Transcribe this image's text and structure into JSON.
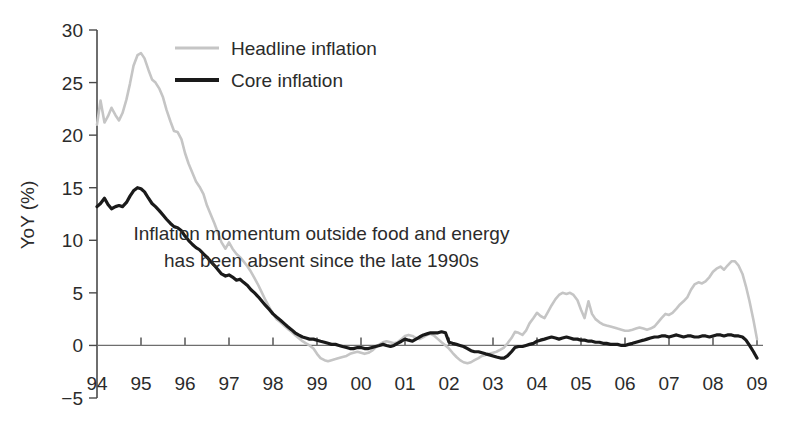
{
  "chart_data": {
    "type": "line",
    "title": "",
    "xlabel": "",
    "ylabel": "YoY (%)",
    "ylim": [
      -5,
      30
    ],
    "xlim": [
      1994,
      2009
    ],
    "grid": false,
    "legend_position": "top-center-left",
    "y_ticks": [
      -5,
      0,
      5,
      10,
      15,
      20,
      25,
      30
    ],
    "y_tick_labels": [
      "−5",
      "0",
      "5",
      "10",
      "15",
      "20",
      "25",
      "30"
    ],
    "x_ticks": [
      1994,
      1995,
      1996,
      1997,
      1998,
      1999,
      2000,
      2001,
      2002,
      2003,
      2004,
      2005,
      2006,
      2007,
      2008,
      2009
    ],
    "x_tick_labels": [
      "94",
      "95",
      "96",
      "97",
      "98",
      "99",
      "00",
      "01",
      "02",
      "03",
      "04",
      "05",
      "06",
      "07",
      "08",
      "09"
    ],
    "annotations": [
      {
        "name": "inflation-momentum-note",
        "lines": [
          "Inflation momentum outside food and energy",
          "has been absent since the late 1990s"
        ],
        "x": 1999.1,
        "y": 10.0
      }
    ],
    "colors": {
      "headline": "#c5c5c5",
      "core": "#1a1a1a",
      "axis": "#4a4a4a",
      "text": "#2b2b2b",
      "background": "#ffffff"
    },
    "series": [
      {
        "name": "Headline inflation",
        "color": "#c5c5c5",
        "width": 2.6,
        "x": [
          1994.0,
          1994.08,
          1994.17,
          1994.25,
          1994.33,
          1994.42,
          1994.5,
          1994.58,
          1994.67,
          1994.75,
          1994.83,
          1994.92,
          1995.0,
          1995.08,
          1995.17,
          1995.25,
          1995.33,
          1995.42,
          1995.5,
          1995.58,
          1995.67,
          1995.75,
          1995.83,
          1995.92,
          1996.0,
          1996.08,
          1996.17,
          1996.25,
          1996.33,
          1996.42,
          1996.5,
          1996.58,
          1996.67,
          1996.75,
          1996.83,
          1996.92,
          1997.0,
          1997.08,
          1997.17,
          1997.25,
          1997.33,
          1997.42,
          1997.5,
          1997.58,
          1997.67,
          1997.75,
          1997.83,
          1997.92,
          1998.0,
          1998.08,
          1998.17,
          1998.25,
          1998.33,
          1998.42,
          1998.5,
          1998.58,
          1998.67,
          1998.75,
          1998.83,
          1998.92,
          1999.0,
          1999.08,
          1999.17,
          1999.25,
          1999.33,
          1999.42,
          1999.5,
          1999.58,
          1999.67,
          1999.75,
          1999.83,
          1999.92,
          2000.0,
          2000.08,
          2000.17,
          2000.25,
          2000.33,
          2000.42,
          2000.5,
          2000.58,
          2000.67,
          2000.75,
          2000.83,
          2000.92,
          2001.0,
          2001.08,
          2001.17,
          2001.25,
          2001.33,
          2001.42,
          2001.5,
          2001.58,
          2001.67,
          2001.75,
          2001.83,
          2001.92,
          2002.0,
          2002.08,
          2002.17,
          2002.25,
          2002.33,
          2002.42,
          2002.5,
          2002.58,
          2002.67,
          2002.75,
          2002.83,
          2002.92,
          2003.0,
          2003.08,
          2003.17,
          2003.25,
          2003.33,
          2003.42,
          2003.5,
          2003.58,
          2003.67,
          2003.75,
          2003.83,
          2003.92,
          2004.0,
          2004.08,
          2004.17,
          2004.25,
          2004.33,
          2004.42,
          2004.5,
          2004.58,
          2004.67,
          2004.75,
          2004.83,
          2004.92,
          2005.0,
          2005.08,
          2005.17,
          2005.25,
          2005.33,
          2005.42,
          2005.5,
          2005.58,
          2005.67,
          2005.75,
          2005.83,
          2005.92,
          2006.0,
          2006.08,
          2006.17,
          2006.25,
          2006.33,
          2006.42,
          2006.5,
          2006.58,
          2006.67,
          2006.75,
          2006.83,
          2006.92,
          2007.0,
          2007.08,
          2007.17,
          2007.25,
          2007.33,
          2007.42,
          2007.5,
          2007.58,
          2007.67,
          2007.75,
          2007.83,
          2007.92,
          2008.0,
          2008.08,
          2008.17,
          2008.25,
          2008.33,
          2008.42,
          2008.5,
          2008.58,
          2008.67,
          2008.75,
          2008.83,
          2008.92,
          2009.0
        ],
        "y": [
          21.0,
          23.3,
          21.2,
          21.8,
          22.6,
          21.9,
          21.4,
          22.1,
          23.4,
          24.9,
          26.6,
          27.6,
          27.8,
          27.3,
          26.2,
          25.3,
          25.0,
          24.4,
          23.6,
          22.4,
          21.3,
          20.4,
          20.3,
          19.6,
          18.3,
          17.3,
          16.4,
          15.6,
          15.1,
          14.4,
          13.3,
          12.5,
          11.6,
          10.7,
          9.8,
          9.2,
          9.8,
          9.2,
          8.7,
          8.4,
          8.0,
          7.5,
          7.0,
          6.4,
          5.7,
          5.0,
          4.3,
          3.6,
          3.0,
          2.5,
          2.2,
          1.9,
          1.6,
          1.3,
          1.0,
          0.7,
          0.4,
          0.2,
          0.0,
          -0.3,
          -0.8,
          -1.2,
          -1.4,
          -1.5,
          -1.4,
          -1.3,
          -1.2,
          -1.1,
          -1.0,
          -0.8,
          -0.7,
          -0.6,
          -0.7,
          -0.8,
          -0.7,
          -0.5,
          -0.2,
          0.1,
          0.3,
          0.4,
          0.3,
          0.2,
          0.3,
          0.6,
          0.9,
          1.0,
          0.9,
          0.7,
          0.6,
          0.8,
          1.0,
          1.1,
          0.9,
          0.6,
          0.3,
          0.0,
          -0.3,
          -0.7,
          -1.1,
          -1.4,
          -1.6,
          -1.7,
          -1.6,
          -1.4,
          -1.2,
          -1.0,
          -0.9,
          -0.8,
          -0.7,
          -0.6,
          -0.4,
          -0.2,
          0.2,
          0.7,
          1.3,
          1.2,
          1.0,
          1.4,
          2.1,
          2.6,
          3.1,
          2.8,
          2.6,
          3.2,
          3.8,
          4.4,
          4.8,
          5.0,
          4.9,
          5.0,
          4.8,
          4.3,
          3.4,
          2.6,
          4.2,
          3.0,
          2.5,
          2.2,
          2.0,
          1.9,
          1.8,
          1.7,
          1.6,
          1.5,
          1.4,
          1.4,
          1.5,
          1.6,
          1.7,
          1.6,
          1.5,
          1.6,
          1.8,
          2.2,
          2.6,
          3.0,
          2.9,
          3.1,
          3.5,
          3.9,
          4.2,
          4.6,
          5.3,
          5.8,
          6.0,
          5.9,
          6.1,
          6.5,
          7.0,
          7.3,
          7.5,
          7.2,
          7.6,
          8.0,
          8.0,
          7.6,
          6.8,
          5.6,
          4.2,
          2.4,
          0.6
        ]
      },
      {
        "name": "Core inflation",
        "color": "#1a1a1a",
        "width": 3.2,
        "x": [
          1994.0,
          1994.08,
          1994.17,
          1994.25,
          1994.33,
          1994.42,
          1994.5,
          1994.58,
          1994.67,
          1994.75,
          1994.83,
          1994.92,
          1995.0,
          1995.08,
          1995.17,
          1995.25,
          1995.33,
          1995.42,
          1995.5,
          1995.58,
          1995.67,
          1995.75,
          1995.83,
          1995.92,
          1996.0,
          1996.08,
          1996.17,
          1996.25,
          1996.33,
          1996.42,
          1996.5,
          1996.58,
          1996.67,
          1996.75,
          1996.83,
          1996.92,
          1997.0,
          1997.08,
          1997.17,
          1997.25,
          1997.33,
          1997.42,
          1997.5,
          1997.58,
          1997.67,
          1997.75,
          1997.83,
          1997.92,
          1998.0,
          1998.08,
          1998.17,
          1998.25,
          1998.33,
          1998.42,
          1998.5,
          1998.58,
          1998.67,
          1998.75,
          1998.83,
          1998.92,
          1999.0,
          1999.08,
          1999.17,
          1999.25,
          1999.33,
          1999.42,
          1999.5,
          1999.58,
          1999.67,
          1999.75,
          1999.83,
          1999.92,
          2000.0,
          2000.08,
          2000.17,
          2000.25,
          2000.33,
          2000.42,
          2000.5,
          2000.58,
          2000.67,
          2000.75,
          2000.83,
          2000.92,
          2001.0,
          2001.08,
          2001.17,
          2001.25,
          2001.33,
          2001.42,
          2001.5,
          2001.58,
          2001.67,
          2001.75,
          2001.83,
          2001.92,
          2002.0,
          2002.08,
          2002.17,
          2002.25,
          2002.33,
          2002.42,
          2002.5,
          2002.58,
          2002.67,
          2002.75,
          2002.83,
          2002.92,
          2003.0,
          2003.08,
          2003.17,
          2003.25,
          2003.33,
          2003.42,
          2003.5,
          2003.58,
          2003.67,
          2003.75,
          2003.83,
          2003.92,
          2004.0,
          2004.08,
          2004.17,
          2004.25,
          2004.33,
          2004.42,
          2004.5,
          2004.58,
          2004.67,
          2004.75,
          2004.83,
          2004.92,
          2005.0,
          2005.08,
          2005.17,
          2005.25,
          2005.33,
          2005.42,
          2005.5,
          2005.58,
          2005.67,
          2005.75,
          2005.83,
          2005.92,
          2006.0,
          2006.08,
          2006.17,
          2006.25,
          2006.33,
          2006.42,
          2006.5,
          2006.58,
          2006.67,
          2006.75,
          2006.83,
          2006.92,
          2007.0,
          2007.08,
          2007.17,
          2007.25,
          2007.33,
          2007.42,
          2007.5,
          2007.58,
          2007.67,
          2007.75,
          2007.83,
          2007.92,
          2008.0,
          2008.08,
          2008.17,
          2008.25,
          2008.33,
          2008.42,
          2008.5,
          2008.58,
          2008.67,
          2008.75,
          2008.83,
          2008.92,
          2009.0
        ],
        "y": [
          13.2,
          13.5,
          14.0,
          13.4,
          13.0,
          13.2,
          13.3,
          13.2,
          13.6,
          14.2,
          14.7,
          15.0,
          14.9,
          14.6,
          14.0,
          13.5,
          13.2,
          12.8,
          12.4,
          12.0,
          11.6,
          11.3,
          11.2,
          10.9,
          10.4,
          10.0,
          9.6,
          9.3,
          9.1,
          8.7,
          8.4,
          8.0,
          7.6,
          7.2,
          6.8,
          6.6,
          6.7,
          6.5,
          6.2,
          6.3,
          6.0,
          5.7,
          5.3,
          5.0,
          4.6,
          4.2,
          3.8,
          3.4,
          3.0,
          2.7,
          2.4,
          2.1,
          1.8,
          1.5,
          1.2,
          1.0,
          0.8,
          0.7,
          0.6,
          0.6,
          0.5,
          0.4,
          0.3,
          0.2,
          0.1,
          0.1,
          0.0,
          -0.1,
          -0.2,
          -0.3,
          -0.3,
          -0.2,
          -0.2,
          -0.3,
          -0.3,
          -0.2,
          -0.1,
          0.0,
          0.1,
          0.0,
          -0.1,
          0.0,
          0.2,
          0.4,
          0.6,
          0.5,
          0.4,
          0.6,
          0.8,
          1.0,
          1.1,
          1.2,
          1.2,
          1.2,
          1.3,
          1.2,
          0.3,
          0.2,
          0.1,
          0.0,
          -0.1,
          -0.3,
          -0.5,
          -0.6,
          -0.6,
          -0.7,
          -0.8,
          -0.9,
          -1.0,
          -1.1,
          -1.2,
          -1.2,
          -1.0,
          -0.6,
          -0.2,
          -0.1,
          -0.1,
          0.0,
          0.1,
          0.2,
          0.4,
          0.5,
          0.6,
          0.7,
          0.8,
          0.7,
          0.6,
          0.7,
          0.8,
          0.7,
          0.6,
          0.6,
          0.5,
          0.5,
          0.4,
          0.4,
          0.3,
          0.3,
          0.2,
          0.2,
          0.1,
          0.1,
          0.1,
          0.0,
          0.0,
          0.1,
          0.2,
          0.3,
          0.4,
          0.5,
          0.6,
          0.7,
          0.8,
          0.8,
          0.9,
          0.9,
          0.8,
          0.9,
          1.0,
          0.9,
          0.8,
          0.9,
          0.9,
          0.8,
          0.8,
          0.9,
          0.9,
          0.8,
          0.9,
          1.0,
          1.0,
          0.9,
          1.0,
          1.0,
          0.9,
          0.9,
          0.8,
          0.5,
          0.0,
          -0.6,
          -1.2
        ]
      }
    ]
  },
  "legend": {
    "items": [
      {
        "label": "Headline inflation",
        "color": "#c5c5c5",
        "width": 3
      },
      {
        "label": "Core inflation",
        "color": "#1a1a1a",
        "width": 4
      }
    ]
  }
}
